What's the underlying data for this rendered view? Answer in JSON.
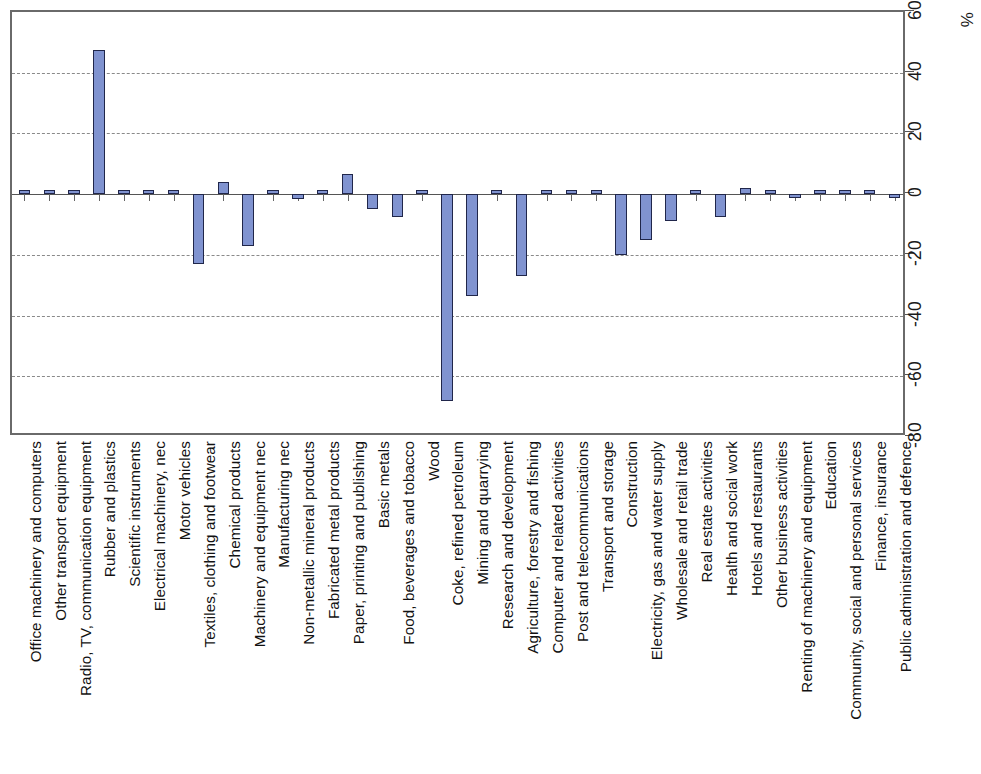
{
  "chart_data": {
    "type": "bar",
    "title": "",
    "subtitle": "",
    "xlabel": "",
    "ylabel": "%",
    "unit_label": "%",
    "orientation": "vertical-bars-rotated-labels",
    "grid": true,
    "legend": null,
    "ylim": [
      -80,
      60
    ],
    "ytick_values": [
      60,
      40,
      20,
      0,
      -20,
      -40,
      -60,
      -80
    ],
    "ytick_labels": [
      "60",
      "40",
      "20",
      "0",
      "-20",
      "-40",
      "-60",
      "-80"
    ],
    "gridline_values": [
      40,
      20,
      -20,
      -40,
      -60
    ],
    "zero_line": 0,
    "series_color": "#8093d0",
    "series_border_color": "#20264a",
    "categories": [
      "Office machinery and computers",
      "Other transport equipment",
      "Radio, TV, communication equipment",
      "Rubber and plastics",
      "Scientific instruments",
      "Electrical machinery, nec",
      "Motor vehicles",
      "Textiles, clothing and footwear",
      "Chemical products",
      "Machinery and equipment nec",
      "Manufacturing nec",
      "Non-metallic mineral products",
      "Fabricated metal products",
      "Paper, printing and publishing",
      "Basic metals",
      "Food, beverages and tobacco",
      "Wood",
      "Coke, refined petroleum",
      "Mining and quarrying",
      "Research and development",
      "Agriculture, forestry and fishing",
      "Computer and related activities",
      "Post and telecommunications",
      "Transport and storage",
      "Construction",
      "Electricity, gas and water supply",
      "Wholesale and retail trade",
      "Real estate activities",
      "Health and social work",
      "Hotels and restaurants",
      "Other business activities",
      "Renting of machinery and equipment",
      "Education",
      "Community, social and personal services",
      "Finance, insurance",
      "Public administration and defence"
    ],
    "values": [
      0,
      0,
      0,
      47.5,
      0,
      0,
      0,
      -23,
      4,
      -17,
      0,
      -1.5,
      0,
      6.5,
      -5,
      -7.5,
      0,
      -68,
      -33.5,
      0,
      -27,
      0,
      0,
      0,
      -20,
      -15,
      -9,
      0,
      -7.5,
      2,
      0,
      -0.5,
      0.8,
      1.2,
      0.8,
      -1.2
    ]
  }
}
